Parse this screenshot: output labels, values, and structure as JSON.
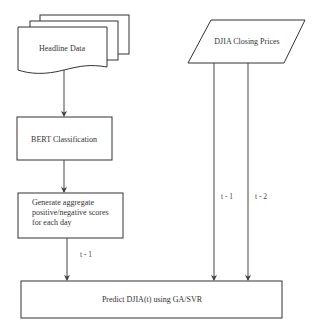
{
  "diagram": {
    "type": "flowchart",
    "nodes": {
      "headline": {
        "label": "Headline Data",
        "shape": "multi-document"
      },
      "djia": {
        "label": "DJIA Closing Prices",
        "shape": "parallelogram"
      },
      "bert": {
        "label": "BERT Classification",
        "shape": "rectangle"
      },
      "aggregate": {
        "label_lines": [
          "Generate aggregate",
          "positive/negative scores",
          "for each day"
        ],
        "shape": "rectangle"
      },
      "predict": {
        "label": "Predict DJIA(t) using GA/SVR",
        "shape": "rectangle"
      }
    },
    "edges": [
      {
        "from": "headline",
        "to": "bert",
        "label": ""
      },
      {
        "from": "bert",
        "to": "aggregate",
        "label": ""
      },
      {
        "from": "aggregate",
        "to": "predict",
        "label": "t - 1"
      },
      {
        "from": "djia",
        "to": "predict",
        "label": "t - 1"
      },
      {
        "from": "djia",
        "to": "predict",
        "label": "t - 2"
      }
    ],
    "colors": {
      "stroke": "#333333",
      "fill": "#ffffff",
      "text": "#333333"
    }
  }
}
